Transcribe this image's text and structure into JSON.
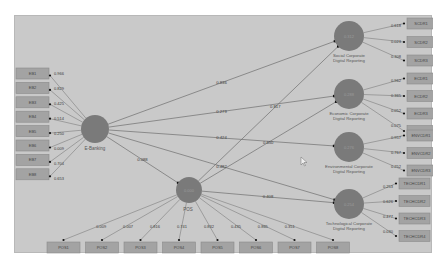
{
  "colors": {
    "canvas_bg": "#c9c9c9",
    "node_fill": "#7a7a7a",
    "indicator_fill": "#a3a3a3",
    "line": "#6e6e6e",
    "text": "#3a3a3a"
  },
  "nodes": {
    "ebanking": {
      "label": "E-Banking",
      "value": ""
    },
    "pos": {
      "label": "POS",
      "value": "0.000"
    },
    "social": {
      "label": "Social Corporate Digital Reporting",
      "value": "0.312"
    },
    "economic": {
      "label": "Economic Corporate Digital Reporting",
      "value": "0.288"
    },
    "environmental": {
      "label": "Environmental Corporate Digital Reporting",
      "value": "0.276"
    },
    "technological": {
      "label": "Technological Corporate Digital Reporting",
      "value": "0.254"
    }
  },
  "paths": [
    {
      "from": "E-Banking",
      "to": "Social Corporate Digital Reporting",
      "coef": "0.836"
    },
    {
      "from": "E-Banking",
      "to": "Economic Corporate Digital Reporting",
      "coef": "0.279"
    },
    {
      "from": "E-Banking",
      "to": "Environmental Corporate Digital Reporting",
      "coef": "0.424"
    },
    {
      "from": "E-Banking",
      "to": "Technological Corporate Digital Reporting",
      "coef": "0.482"
    },
    {
      "from": "E-Banking",
      "to": "POS",
      "coef": "0.088"
    },
    {
      "from": "POS",
      "to": "Social Corporate Digital Reporting",
      "coef": "0.817"
    },
    {
      "from": "POS",
      "to": "Economic Corporate Digital Reporting",
      "coef": "0.650"
    },
    {
      "from": "POS",
      "to": "Technological Corporate Digital Reporting",
      "coef": "0.408"
    }
  ],
  "ebanking_indicators": [
    {
      "name": "EB1",
      "loading": "0.966"
    },
    {
      "name": "EB2",
      "loading": "0.829"
    },
    {
      "name": "EB3",
      "loading": "0.425"
    },
    {
      "name": "EB4",
      "loading": "0.514"
    },
    {
      "name": "EB5",
      "loading": "0.250"
    },
    {
      "name": "EB6",
      "loading": "0.009"
    },
    {
      "name": "EB7",
      "loading": "0.704"
    },
    {
      "name": "EB8",
      "loading": "0.653"
    }
  ],
  "pos_indicators": [
    {
      "name": "POS1",
      "loading": "0.009"
    },
    {
      "name": "POS2",
      "loading": "0.007"
    },
    {
      "name": "POS3",
      "loading": "0.816"
    },
    {
      "name": "POS4",
      "loading": "0.741"
    },
    {
      "name": "POS5",
      "loading": "0.832"
    },
    {
      "name": "POS6",
      "loading": "0.435"
    },
    {
      "name": "POS7",
      "loading": "0.865"
    },
    {
      "name": "POS8",
      "loading": "0.351"
    }
  ],
  "social_indicators": [
    {
      "name": "SCDR1",
      "loading": "0.618"
    },
    {
      "name": "SCDR2",
      "loading": "0.023"
    },
    {
      "name": "SCDR3",
      "loading": "0.308"
    }
  ],
  "economic_indicators": [
    {
      "name": "ECDR1",
      "loading": "0.962"
    },
    {
      "name": "ECDR2",
      "loading": "0.365"
    },
    {
      "name": "ECDR3",
      "loading": "0.052"
    },
    {
      "name": "ECDR4",
      "loading": "0.075"
    }
  ],
  "environmental_indicators": [
    {
      "name": "ENVCDR1",
      "loading": "0.957"
    },
    {
      "name": "ENVCDR2",
      "loading": "0.767"
    },
    {
      "name": "ENVCDR3",
      "loading": "0.252"
    }
  ],
  "technological_indicators": [
    {
      "name": "TECHCDR1",
      "loading": "0.253"
    },
    {
      "name": "TECHCDR2",
      "loading": "0.626"
    },
    {
      "name": "TECHCDR3",
      "loading": "0.477"
    },
    {
      "name": "TECHCDR4",
      "loading": "0.030"
    }
  ]
}
